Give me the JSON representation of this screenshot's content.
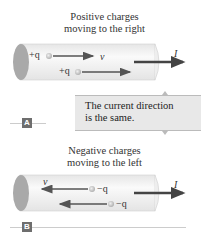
{
  "panel_a": {
    "label": "A",
    "caption_line1": "Positive charges",
    "caption_line2": "moving to the right",
    "charge1": "+q",
    "charge2": "+q",
    "velocity_symbol": "v⃗",
    "current_symbol": "I",
    "charge_direction": "right",
    "current_direction": "right"
  },
  "callout": {
    "line1": "The current direction",
    "line2": "is the same."
  },
  "panel_b": {
    "label": "B",
    "caption_line1": "Negative charges",
    "caption_line2": "moving to the left",
    "charge1": "−q",
    "charge2": "−q",
    "velocity_symbol": "v⃗",
    "current_symbol": "I",
    "charge_direction": "left",
    "current_direction": "right"
  },
  "colors": {
    "cylinder_fill": "#f2f2f2",
    "cylinder_end": "#a9a9a9",
    "arrow": "#555555",
    "current_arrow": "#444444",
    "callout_bg": "#e8e8e8",
    "label_bg": "#6e6e6e"
  }
}
